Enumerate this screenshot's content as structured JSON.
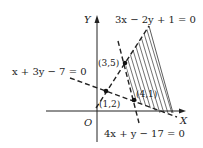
{
  "axes": {
    "x_label": "X",
    "y_label": "Y",
    "origin_label": "O"
  },
  "lines": [
    {
      "id": "line1",
      "equation": "3x − 2y + 1 = 0"
    },
    {
      "id": "line2",
      "equation": "x + 3y − 7 = 0"
    },
    {
      "id": "line3",
      "equation": "4x + y − 17 = 0"
    }
  ],
  "points": [
    {
      "label": "(3,5)"
    },
    {
      "label": "(1,2)"
    },
    {
      "label": "(4,1)"
    }
  ],
  "colors": {
    "ink": "#222222",
    "background": "#ffffff"
  }
}
